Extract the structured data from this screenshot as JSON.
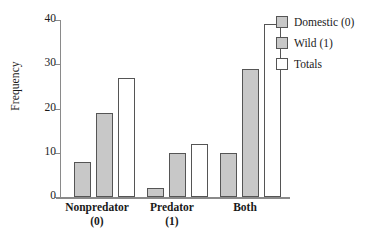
{
  "chart_data": {
    "type": "bar",
    "title": "",
    "xlabel": "",
    "ylabel": "Frequency",
    "ylim": [
      0,
      40
    ],
    "yticks": [
      0,
      10,
      20,
      30,
      40
    ],
    "ytick_labels": [
      "0",
      "10",
      "20",
      "30",
      "40"
    ],
    "grid": false,
    "legend_position": "top-right",
    "categories": [
      "Nonpredator (0)",
      "Predator (1)",
      "Both"
    ],
    "category_lines": [
      {
        "line1": "Nonpredator",
        "line2": "(0)"
      },
      {
        "line1": "Predator",
        "line2": "(1)"
      },
      {
        "line1": "Both",
        "line2": ""
      }
    ],
    "series": [
      {
        "name": "Domestic (0)",
        "values": [
          8,
          2,
          10
        ],
        "color": "#c8c8c8",
        "edge": "#555555"
      },
      {
        "name": "Wild (1)",
        "values": [
          19,
          10,
          29
        ],
        "color": "#c8c8c8",
        "edge": "#555555"
      },
      {
        "name": "Totals",
        "values": [
          27,
          12,
          39
        ],
        "color": "#ffffff",
        "edge": "#555555"
      }
    ]
  },
  "legend": {
    "items": [
      {
        "label": "Domestic (0)",
        "swatch": "domestic"
      },
      {
        "label": "Wild (1)",
        "swatch": "wild"
      },
      {
        "label": "Totals",
        "swatch": "totals"
      }
    ]
  },
  "axis": {
    "y_title": "Frequency",
    "tick_0": "0",
    "tick_1": "10",
    "tick_2": "20",
    "tick_3": "30",
    "tick_4": "40"
  },
  "xaxis": {
    "cat0_line1": "Nonpredator",
    "cat0_line2": "(0)",
    "cat1_line1": "Predator",
    "cat1_line2": "(1)",
    "cat2_line1": "Both",
    "cat2_line2": ""
  }
}
